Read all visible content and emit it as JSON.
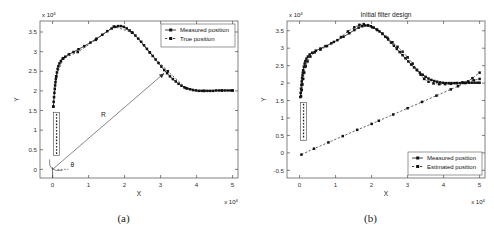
{
  "figure": {
    "panels": [
      {
        "caption": "(a)",
        "title": "",
        "xlabel": "X",
        "ylabel": "Y",
        "x_exponent": "x 10",
        "y_exponent": "x 10",
        "exp_sup": "4",
        "xticks": [
          "0",
          "1",
          "2",
          "3",
          "4",
          "5"
        ],
        "yticks": [
          "0",
          "0.5",
          "1",
          "1.5",
          "2",
          "2.5",
          "3",
          "3.5"
        ],
        "legend": [
          {
            "label": "Measured position",
            "style": "solid-marker"
          },
          {
            "label": "True position",
            "style": "dashed-marker"
          }
        ],
        "annotations": [
          {
            "name": "range-label",
            "text": "R"
          },
          {
            "name": "angle-label",
            "text": "θ"
          }
        ]
      },
      {
        "caption": "(b)",
        "title": "Initial filter design",
        "xlabel": "X",
        "ylabel": "Y",
        "x_exponent": "x 10",
        "y_exponent": "x 10",
        "exp_sup": "4",
        "xticks": [
          "0",
          "1",
          "2",
          "3",
          "4",
          "5"
        ],
        "yticks": [
          "-0.5",
          "0",
          "0.5",
          "1",
          "1.5",
          "2",
          "2.5",
          "3",
          "3.5"
        ],
        "legend": [
          {
            "label": "Measured position",
            "style": "solid-marker"
          },
          {
            "label": "Estimated position",
            "style": "dashed-marker"
          }
        ],
        "annotations": []
      }
    ]
  },
  "chart_data": [
    {
      "type": "scatter",
      "panel": "(a)",
      "title": "",
      "xlabel": "X",
      "ylabel": "Y",
      "x_scale": 10000,
      "y_scale": 10000,
      "xlim": [
        -0.35,
        5.15
      ],
      "ylim": [
        -0.22,
        3.78
      ],
      "grid": false,
      "legend_position": "top-right",
      "series": [
        {
          "name": "Measured position",
          "style": "solid-marker",
          "x": [
            0.02,
            0.03,
            0.04,
            0.05,
            0.06,
            0.07,
            0.08,
            0.09,
            0.1,
            0.12,
            0.14,
            0.16,
            0.19,
            0.23,
            0.28,
            0.35,
            0.45,
            0.58,
            0.72,
            0.88,
            1.05,
            1.22,
            1.38,
            1.52,
            1.64,
            1.74,
            1.82,
            1.9,
            1.98,
            2.06,
            2.14,
            2.22,
            2.3,
            2.38,
            2.46,
            2.54,
            2.62,
            2.7,
            2.78,
            2.86,
            2.94,
            3.02,
            3.1,
            3.18,
            3.26,
            3.34,
            3.42,
            3.5,
            3.58,
            3.66,
            3.74,
            3.82,
            3.9,
            3.98,
            4.06,
            4.14,
            4.22,
            4.3,
            4.38,
            4.46,
            4.54,
            4.62,
            4.7,
            4.78,
            4.86,
            4.94,
            5.0
          ],
          "y": [
            1.6,
            1.72,
            1.84,
            1.95,
            2.05,
            2.14,
            2.22,
            2.3,
            2.37,
            2.47,
            2.56,
            2.63,
            2.7,
            2.76,
            2.82,
            2.87,
            2.93,
            2.99,
            3.06,
            3.14,
            3.23,
            3.33,
            3.43,
            3.52,
            3.59,
            3.63,
            3.65,
            3.65,
            3.63,
            3.59,
            3.54,
            3.48,
            3.41,
            3.33,
            3.25,
            3.16,
            3.07,
            2.98,
            2.89,
            2.8,
            2.71,
            2.62,
            2.53,
            2.45,
            2.37,
            2.3,
            2.24,
            2.18,
            2.13,
            2.09,
            2.06,
            2.04,
            2.02,
            2.01,
            2.0,
            2.0,
            2.0,
            2.0,
            2.0,
            2.0,
            2.01,
            2.01,
            2.01,
            2.01,
            2.01,
            2.01,
            2.01
          ]
        },
        {
          "name": "True position",
          "style": "dashed-marker",
          "x": [
            0.02,
            0.1,
            0.3,
            0.7,
            1.2,
            1.7,
            2.2,
            2.7,
            3.2,
            3.7,
            4.2,
            4.7,
            5.0
          ],
          "y": [
            1.6,
            2.37,
            2.83,
            2.99,
            3.3,
            3.64,
            3.49,
            2.98,
            2.5,
            2.07,
            2.0,
            2.01,
            2.01
          ]
        }
      ],
      "annotations": [
        {
          "name": "range-arrow",
          "label": "R",
          "from": [
            0.0,
            0.0
          ],
          "to": [
            3.1,
            2.45
          ]
        },
        {
          "name": "angle-label",
          "label": "θ",
          "at": [
            0.55,
            0.05
          ]
        },
        {
          "name": "sensor-box",
          "x_range": [
            0.03,
            0.19
          ],
          "y_range": [
            0.35,
            1.45
          ]
        }
      ]
    },
    {
      "type": "scatter",
      "panel": "(b)",
      "title": "Initial filter design",
      "xlabel": "X",
      "ylabel": "Y",
      "x_scale": 10000,
      "y_scale": 10000,
      "xlim": [
        -0.35,
        5.15
      ],
      "ylim": [
        -0.72,
        3.78
      ],
      "grid": false,
      "legend_position": "bottom-right",
      "series": [
        {
          "name": "Measured position",
          "style": "solid-marker",
          "x": [
            0.02,
            0.03,
            0.04,
            0.05,
            0.06,
            0.07,
            0.08,
            0.09,
            0.1,
            0.12,
            0.14,
            0.16,
            0.19,
            0.23,
            0.28,
            0.35,
            0.45,
            0.58,
            0.72,
            0.88,
            1.05,
            1.22,
            1.38,
            1.52,
            1.64,
            1.74,
            1.82,
            1.9,
            1.98,
            2.06,
            2.14,
            2.22,
            2.3,
            2.38,
            2.46,
            2.54,
            2.62,
            2.7,
            2.78,
            2.86,
            2.94,
            3.02,
            3.1,
            3.18,
            3.26,
            3.34,
            3.42,
            3.5,
            3.58,
            3.66,
            3.74,
            3.82,
            3.9,
            3.98,
            4.06,
            4.14,
            4.22,
            4.3,
            4.38,
            4.46,
            4.54,
            4.62,
            4.7,
            4.78,
            4.86,
            4.94,
            5.0
          ],
          "y": [
            1.6,
            1.72,
            1.84,
            1.95,
            2.05,
            2.14,
            2.22,
            2.3,
            2.37,
            2.47,
            2.56,
            2.63,
            2.7,
            2.76,
            2.82,
            2.87,
            2.93,
            2.99,
            3.06,
            3.14,
            3.23,
            3.33,
            3.43,
            3.52,
            3.59,
            3.63,
            3.65,
            3.65,
            3.63,
            3.59,
            3.54,
            3.48,
            3.41,
            3.33,
            3.25,
            3.16,
            3.07,
            2.98,
            2.89,
            2.8,
            2.71,
            2.62,
            2.53,
            2.45,
            2.37,
            2.3,
            2.24,
            2.18,
            2.13,
            2.09,
            2.06,
            2.04,
            2.02,
            2.01,
            2.0,
            2.0,
            2.0,
            2.0,
            2.0,
            2.0,
            2.01,
            2.01,
            2.01,
            2.01,
            2.01,
            2.01,
            2.01
          ]
        },
        {
          "name": "Estimated position (track)",
          "style": "dashed-marker",
          "x": [
            0.04,
            0.06,
            0.08,
            0.1,
            0.13,
            0.17,
            0.22,
            0.3,
            0.42,
            0.58,
            0.76,
            0.95,
            1.15,
            1.34,
            1.52,
            1.66,
            1.78,
            1.9,
            2.02,
            2.16,
            2.3,
            2.44,
            2.58,
            2.72,
            2.86,
            3.0,
            3.14,
            3.26,
            3.36,
            3.46,
            3.58,
            3.72,
            3.88,
            4.04,
            4.2,
            4.36,
            4.52,
            4.68,
            4.84,
            5.0
          ],
          "y": [
            1.62,
            1.8,
            1.96,
            2.12,
            2.3,
            2.48,
            2.62,
            2.76,
            2.88,
            2.96,
            3.06,
            3.18,
            3.32,
            3.48,
            3.6,
            3.67,
            3.69,
            3.66,
            3.6,
            3.52,
            3.42,
            3.3,
            3.17,
            3.04,
            2.9,
            2.74,
            2.56,
            2.38,
            2.24,
            2.12,
            2.04,
            1.99,
            1.97,
            1.97,
            1.98,
            2.0,
            2.02,
            2.05,
            2.08,
            2.12
          ]
        },
        {
          "name": "Estimated position (initial ramp)",
          "style": "dashed-marker",
          "x": [
            0.05,
            0.4,
            0.8,
            1.2,
            1.6,
            2.0,
            2.2,
            2.6,
            3.0,
            3.4,
            3.8,
            4.2,
            4.4,
            4.6,
            4.8,
            5.0
          ],
          "y": [
            -0.05,
            0.12,
            0.3,
            0.48,
            0.66,
            0.83,
            0.92,
            1.1,
            1.28,
            1.46,
            1.64,
            1.82,
            1.91,
            2.0,
            2.14,
            2.3
          ]
        }
      ],
      "annotations": [
        {
          "name": "sensor-box",
          "x_range": [
            0.03,
            0.19
          ],
          "y_range": [
            0.35,
            1.45
          ]
        }
      ]
    }
  ]
}
